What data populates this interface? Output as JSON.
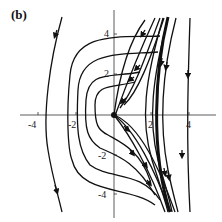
{
  "figure": {
    "label": "(b)",
    "type": "phase-portrait",
    "x_ticks": [
      "-4",
      "-2",
      "2",
      "4"
    ],
    "y_ticks": [
      "4",
      "2",
      "-2",
      "-4"
    ],
    "equilibrium": {
      "x": 0,
      "y": 0,
      "marker": "filled-dot"
    }
  }
}
